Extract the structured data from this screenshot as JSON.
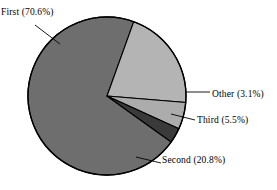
{
  "chart_data": {
    "type": "pie",
    "title": "",
    "subtitle": "",
    "xlabel": "",
    "ylabel": "",
    "grid": false,
    "legend_position": "none",
    "label_style": "outside-with-leader-lines",
    "start_angle_deg": 0,
    "direction": "clockwise",
    "categories": [
      "First",
      "Second",
      "Third",
      "Other"
    ],
    "values": [
      70.6,
      20.8,
      5.5,
      3.1
    ],
    "unit": "%",
    "slices": [
      {
        "name": "First",
        "value": 70.6,
        "label": "First (70.6%)",
        "color": "#6e6e6e",
        "start_deg": 35.6,
        "end_deg": 289.8
      },
      {
        "name": "Second",
        "value": 20.8,
        "label": "Second (20.8%)",
        "color": "#b4b4b4",
        "start_deg": 289.8,
        "end_deg": 364.7
      },
      {
        "name": "Third",
        "value": 5.5,
        "label": "Third (5.5%)",
        "color": "#acacac",
        "start_deg": 364.7,
        "end_deg": 384.5
      },
      {
        "name": "Other",
        "value": 3.1,
        "label": "Other (3.1%)",
        "color": "#3a3a3a",
        "start_deg": 384.5,
        "end_deg": 395.6
      }
    ],
    "labels": {
      "first": "First (70.6%)",
      "second": "Second (20.8%)",
      "third": "Third (5.5%)",
      "other": "Other (3.1%)"
    },
    "colors": {
      "first": "#6e6e6e",
      "second": "#b4b4b4",
      "third": "#acacac",
      "other": "#3a3a3a",
      "outline": "#000000",
      "background": "#ffffff",
      "text": "#000000"
    },
    "geometry": {
      "center_x": 107,
      "center_y": 96,
      "radius": 79
    }
  }
}
